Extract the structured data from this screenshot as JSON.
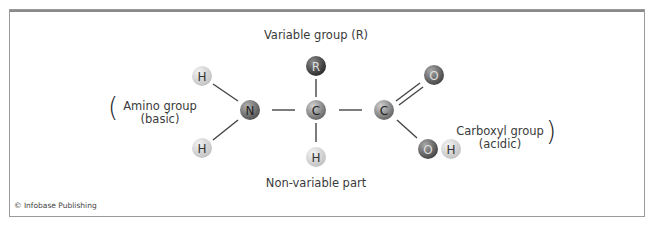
{
  "diagram": {
    "title_top": "Variable group (R)",
    "label_bottom": "Non-variable part",
    "amino_group": {
      "line1": "Amino group",
      "line2": "(basic)",
      "open_paren": "("
    },
    "carboxyl_group": {
      "line1": "Carboxyl group",
      "line2": "(acidic)",
      "close_paren": ")"
    },
    "credit": "© Infobase Publishing",
    "atoms": [
      {
        "id": "H1",
        "symbol": "H",
        "cx": 202,
        "cy": 76,
        "type": "hydrogen"
      },
      {
        "id": "H2",
        "symbol": "H",
        "cx": 202,
        "cy": 148,
        "type": "hydrogen"
      },
      {
        "id": "N",
        "symbol": "N",
        "cx": 250,
        "cy": 110,
        "type": "nitrogen"
      },
      {
        "id": "Ca",
        "symbol": "C",
        "cx": 316,
        "cy": 110,
        "type": "carbon"
      },
      {
        "id": "R",
        "symbol": "R",
        "cx": 316,
        "cy": 66,
        "type": "rgroup"
      },
      {
        "id": "H3",
        "symbol": "H",
        "cx": 316,
        "cy": 157,
        "type": "hydrogen"
      },
      {
        "id": "C2",
        "symbol": "C",
        "cx": 384,
        "cy": 110,
        "type": "carbon"
      },
      {
        "id": "O1",
        "symbol": "O",
        "cx": 434,
        "cy": 75,
        "type": "oxygen"
      },
      {
        "id": "O2",
        "symbol": "O",
        "cx": 428,
        "cy": 149,
        "type": "oxygen"
      },
      {
        "id": "H4",
        "symbol": "H",
        "cx": 451,
        "cy": 149,
        "type": "hydrogen"
      }
    ],
    "colors": {
      "hydrogen": "#d6d6d6",
      "nitrogen": "#7a7a7a",
      "carbon": "#9c9c9c",
      "rgroup": "#555555",
      "oxygen": "#6f6f6f",
      "bond": "#444444"
    }
  }
}
